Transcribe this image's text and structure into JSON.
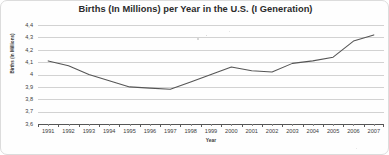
{
  "chart_data": {
    "type": "line",
    "title": "Births (In Millions) per Year in the U.S. (I Generation)",
    "xlabel": "Year",
    "ylabel": "Births (In Millions)",
    "categories": [
      "1991",
      "1992",
      "1993",
      "1994",
      "1995",
      "1996",
      "1997",
      "1998",
      "1999",
      "2000",
      "2001",
      "2002",
      "2003",
      "2004",
      "2005",
      "2006",
      "2007"
    ],
    "values": [
      4.11,
      4.07,
      4.0,
      3.95,
      3.9,
      3.89,
      3.88,
      3.94,
      4.0,
      4.06,
      4.03,
      4.02,
      4.09,
      4.11,
      4.14,
      4.27,
      4.32
    ],
    "series": [
      {
        "name": "Births (In Millions)",
        "values": [
          4.11,
          4.07,
          4.0,
          3.95,
          3.9,
          3.89,
          3.88,
          3.94,
          4.0,
          4.06,
          4.03,
          4.02,
          4.09,
          4.11,
          4.14,
          4.27,
          4.32
        ]
      }
    ],
    "ylim": [
      3.6,
      4.4
    ],
    "ytick_labels": [
      "4,4",
      "4,3",
      "4,2",
      "4,1",
      "4",
      "3,9",
      "3,8",
      "3,7",
      "3,6"
    ],
    "ytick_values": [
      4.4,
      4.3,
      4.2,
      4.1,
      4.0,
      3.9,
      3.8,
      3.7,
      3.6
    ],
    "grid": true,
    "legend": "none",
    "line_color": "#555555",
    "grid_color": "#d2d2d2"
  }
}
